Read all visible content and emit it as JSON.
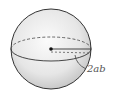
{
  "diagram": {
    "type": "sphere",
    "label": "2ab",
    "colors": {
      "outline": "#333333",
      "fill_center": "#fafafa",
      "fill_edge": "#cfcfcf",
      "label": "#555555"
    }
  }
}
